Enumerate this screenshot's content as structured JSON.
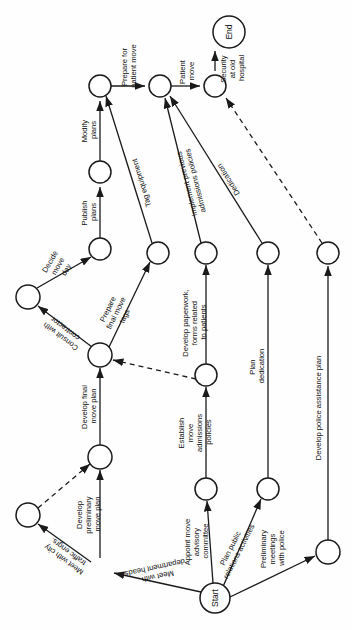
{
  "diagram": {
    "type": "activity-on-arrow-network",
    "orientation": "rotated-90-clockwise",
    "colors": {
      "stroke": "#1a1a1a",
      "background": "#ffffff",
      "text": "#111111"
    },
    "nodes": [
      {
        "id": "end",
        "label": "End",
        "x": 229,
        "y": 32,
        "r": 16
      },
      {
        "id": "n1",
        "label": "",
        "x": 215,
        "y": 86,
        "r": 11
      },
      {
        "id": "n2",
        "label": "",
        "x": 160,
        "y": 86,
        "r": 11
      },
      {
        "id": "n3",
        "label": "",
        "x": 100,
        "y": 86,
        "r": 11
      },
      {
        "id": "n4",
        "label": "",
        "x": 100,
        "y": 172,
        "r": 11
      },
      {
        "id": "n5",
        "label": "",
        "x": 100,
        "y": 249,
        "r": 11
      },
      {
        "id": "n6",
        "label": "",
        "x": 158,
        "y": 253,
        "r": 11
      },
      {
        "id": "n7",
        "label": "",
        "x": 206,
        "y": 253,
        "r": 11
      },
      {
        "id": "n8",
        "label": "",
        "x": 268,
        "y": 253,
        "r": 11
      },
      {
        "id": "n9",
        "label": "",
        "x": 328,
        "y": 253,
        "r": 11
      },
      {
        "id": "n10",
        "label": "",
        "x": 28,
        "y": 297,
        "r": 12
      },
      {
        "id": "n11",
        "label": "",
        "x": 100,
        "y": 355,
        "r": 12
      },
      {
        "id": "n12",
        "label": "",
        "x": 206,
        "y": 375,
        "r": 11
      },
      {
        "id": "n13",
        "label": "",
        "x": 100,
        "y": 457,
        "r": 12
      },
      {
        "id": "n14",
        "label": "",
        "x": 28,
        "y": 515,
        "r": 12
      },
      {
        "id": "n15",
        "label": "",
        "x": 206,
        "y": 489,
        "r": 11
      },
      {
        "id": "n16",
        "label": "",
        "x": 268,
        "y": 489,
        "r": 11
      },
      {
        "id": "n17",
        "label": "",
        "x": 328,
        "y": 552,
        "r": 12
      },
      {
        "id": "start",
        "label": "Start",
        "x": 215,
        "y": 598,
        "r": 15
      }
    ],
    "activities": [
      {
        "id": "a1",
        "label": "Security at old hospital",
        "from": "n1",
        "to": "end"
      },
      {
        "id": "a2",
        "label": "Patient move",
        "from": "n2",
        "to": "n1"
      },
      {
        "id": "a3",
        "label": "Prepare for patient move",
        "from": "n3",
        "to": "n2"
      },
      {
        "id": "a4",
        "label": "Modify plans",
        "from": "n4",
        "to": "n3"
      },
      {
        "id": "a5",
        "label": "Publish plans",
        "from": "n5",
        "to": "n4"
      },
      {
        "id": "a6",
        "label": "Decide move day",
        "from": "n10",
        "to": "n5"
      },
      {
        "id": "a7",
        "label": "Consult with contractor",
        "from": "n11",
        "to": "n10"
      },
      {
        "id": "a8",
        "label": "Prepare final move tags",
        "from": "n11",
        "to": "n6"
      },
      {
        "id": "a9",
        "label": "Tag equipment",
        "from": "n6",
        "to": "n3"
      },
      {
        "id": "a10",
        "label": "Implement previous admissions policies",
        "from": "n7",
        "to": "n2"
      },
      {
        "id": "a11",
        "label": "Dedication",
        "from": "n8",
        "to": "n2"
      },
      {
        "id": "a12",
        "label": "Develop final move plan",
        "from": "n13",
        "to": "n11"
      },
      {
        "id": "a13",
        "label": "Develop preliminary move plan",
        "from": "n16b",
        "to": "n13"
      },
      {
        "id": "a14",
        "label": "Meet with city traffic engrs.",
        "from": "n17b",
        "to": "n14"
      },
      {
        "id": "a15",
        "label": "Meet with department heads",
        "from": "start",
        "to": "n17b"
      },
      {
        "id": "a16",
        "label": "Develop paperwork, forms related to patients",
        "from": "n12",
        "to": "n7"
      },
      {
        "id": "a17",
        "label": "Establish move admissions policies",
        "from": "n15",
        "to": "n12"
      },
      {
        "id": "a18",
        "label": "Appoint move advisory committee",
        "from": "start",
        "to": "n15"
      },
      {
        "id": "a19",
        "label": "Plan dedication",
        "from": "n16",
        "to": "n8"
      },
      {
        "id": "a20",
        "label": "Plan public relations activities",
        "from": "start",
        "to": "n16"
      },
      {
        "id": "a21",
        "label": "Preliminary meetings with police",
        "from": "start",
        "to": "n17"
      },
      {
        "id": "a22",
        "label": "Develop police assistance plan",
        "from": "n17",
        "to": "n9"
      }
    ],
    "dummy_activities": [
      {
        "id": "d1",
        "from": "n9",
        "to": "n1"
      },
      {
        "id": "d2",
        "from": "n14",
        "to": "n13"
      },
      {
        "id": "d3",
        "from": "n12",
        "to": "n11"
      }
    ]
  }
}
